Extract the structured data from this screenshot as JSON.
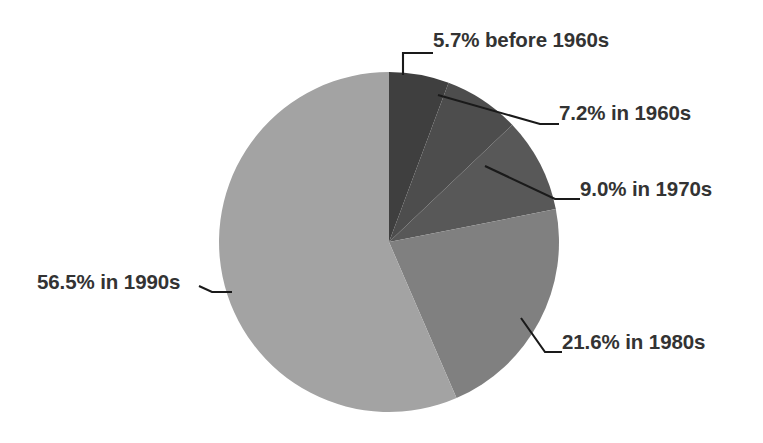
{
  "chart_data": {
    "type": "pie",
    "title": "",
    "subtitle": "",
    "xlabel": "",
    "ylabel": "",
    "legend_position": "none",
    "grid": false,
    "start_angle_deg": 0,
    "direction": "clockwise",
    "categories": [
      "before 1960s",
      "1960s",
      "1970s",
      "1980s",
      "1990s"
    ],
    "values": [
      5.7,
      7.2,
      9.0,
      21.6,
      56.5
    ],
    "value_unit": "%",
    "colors": [
      "#3f3f3f",
      "#4d4d4d",
      "#585858",
      "#808080",
      "#a3a3a3"
    ],
    "slices": [
      {
        "label": "5.7% before 1960s",
        "category": "before 1960s",
        "value": 5.7,
        "color": "#3f3f3f"
      },
      {
        "label": "7.2% in 1960s",
        "category": "1960s",
        "value": 7.2,
        "color": "#4d4d4d"
      },
      {
        "label": "9.0% in 1970s",
        "category": "1970s",
        "value": 9.0,
        "color": "#585858"
      },
      {
        "label": "21.6% in 1980s",
        "category": "1980s",
        "value": 21.6,
        "color": "#808080"
      },
      {
        "label": "56.5% in 1990s",
        "category": "1990s",
        "value": 56.5,
        "color": "#a3a3a3"
      }
    ],
    "annotations": [
      "5.7% before 1960s",
      "7.2% in 1960s",
      "9.0% in 1970s",
      "21.6% in 1980s",
      "56.5% in 1990s"
    ]
  },
  "labels": {
    "before_1960s": "5.7% before 1960s",
    "in_1960s": "7.2% in 1960s",
    "in_1970s": "9.0% in 1970s",
    "in_1980s": "21.6% in 1980s",
    "in_1990s": "56.5% in 1990s"
  },
  "style": {
    "background": "#ffffff",
    "text_color": "#333333",
    "leader_line_color": "#1a1a1a"
  }
}
